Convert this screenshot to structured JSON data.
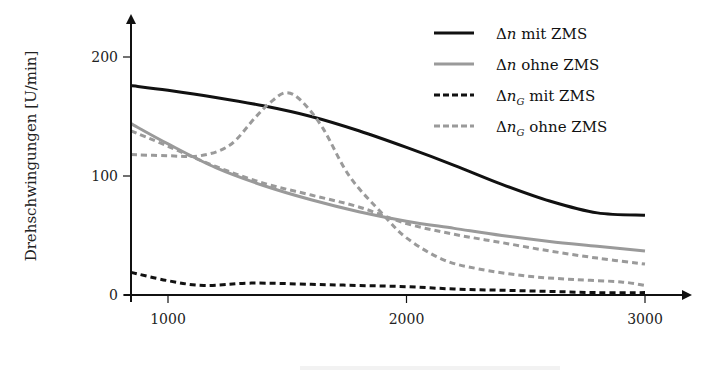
{
  "chart_data": {
    "type": "line",
    "title": "",
    "xlabel": "",
    "xlabel_note": "x-axis title cropped at bottom edge of image (illegible)",
    "ylabel": "Drehschwingungen [U/min]",
    "xlim": [
      845,
      3150
    ],
    "ylim": [
      0,
      235
    ],
    "xticks": [
      1000,
      2000,
      3000
    ],
    "xtick_labels": [
      "1000",
      "2000",
      "3000"
    ],
    "yticks": [
      0,
      100,
      200
    ],
    "ytick_labels": [
      "0",
      "100",
      "200"
    ],
    "grid": false,
    "legend_position": "upper right",
    "legend": [
      {
        "symbol": "Δ",
        "var": "n",
        "sub": "",
        "suffix": " mit ZMS",
        "color": "#111111",
        "style": "solid",
        "width": 3
      },
      {
        "symbol": "Δ",
        "var": "n",
        "sub": "",
        "suffix": " ohne ZMS",
        "color": "#9a9a9a",
        "style": "solid",
        "width": 3
      },
      {
        "symbol": "Δ",
        "var": "n",
        "sub": "G",
        "suffix": " mit ZMS",
        "color": "#111111",
        "style": "dashed",
        "width": 3
      },
      {
        "symbol": "Δ",
        "var": "n",
        "sub": "G",
        "suffix": " ohne ZMS",
        "color": "#9a9a9a",
        "style": "dashed",
        "width": 3
      }
    ],
    "series": [
      {
        "name": "Δn mit ZMS",
        "color": "#111111",
        "style": "solid",
        "width": 3,
        "x": [
          845,
          1000,
          1200,
          1400,
          1600,
          1800,
          2000,
          2200,
          2400,
          2600,
          2800,
          3000
        ],
        "y": [
          176,
          172,
          166,
          159,
          150,
          138,
          124,
          109,
          93,
          79,
          69,
          67
        ]
      },
      {
        "name": "Δn ohne ZMS",
        "color": "#9a9a9a",
        "style": "solid",
        "width": 3,
        "x": [
          845,
          1000,
          1200,
          1400,
          1600,
          1800,
          2000,
          2200,
          2400,
          2600,
          2800,
          3000
        ],
        "y": [
          144,
          127,
          107,
          92,
          80,
          70,
          62,
          56,
          50,
          45,
          41,
          37
        ]
      },
      {
        "name": "Δn_G mit ZMS",
        "color": "#111111",
        "style": "dashed",
        "width": 3,
        "x": [
          845,
          1000,
          1150,
          1350,
          1600,
          1800,
          2000,
          2200,
          2400,
          2600,
          2800,
          3000
        ],
        "y": [
          19,
          12,
          8,
          10,
          9,
          8,
          7,
          5,
          4,
          3,
          2,
          2
        ]
      },
      {
        "name": "Δn_G ohne ZMS (a)",
        "color": "#9a9a9a",
        "style": "dashed",
        "width": 3,
        "x": [
          845,
          1000,
          1200,
          1400,
          1600,
          1800,
          2000,
          2200,
          2400,
          2600,
          2800,
          3000
        ],
        "y": [
          138,
          125,
          108,
          94,
          84,
          74,
          60,
          51,
          44,
          37,
          31,
          26
        ]
      },
      {
        "name": "Δn_G ohne ZMS (b)",
        "color": "#9a9a9a",
        "style": "dashed",
        "width": 3,
        "x": [
          845,
          1000,
          1135,
          1260,
          1365,
          1430,
          1495,
          1560,
          1650,
          1760,
          1900,
          2000,
          2150,
          2300,
          2500,
          2700,
          2900,
          3000
        ],
        "y": [
          118,
          117,
          117,
          126,
          149,
          162,
          170,
          163,
          140,
          100,
          68,
          48,
          30,
          22,
          16,
          13,
          11,
          8
        ]
      }
    ]
  },
  "plot": {
    "y_axis_label": "Drehschwingungen [U/min]"
  }
}
